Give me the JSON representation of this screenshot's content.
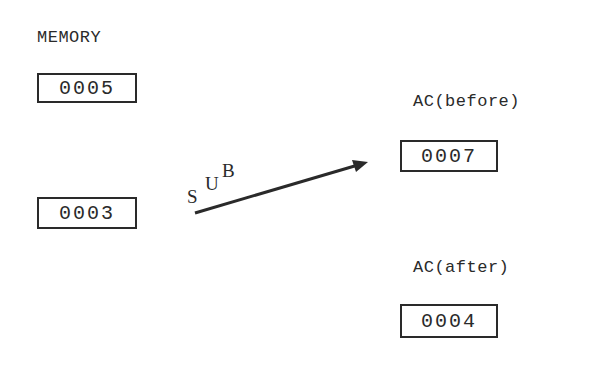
{
  "memory": {
    "title": "MEMORY",
    "cells": [
      {
        "value": "0005"
      },
      {
        "value": "0003"
      }
    ]
  },
  "operation": {
    "letters": [
      "S",
      "U",
      "B"
    ],
    "name": "SUB"
  },
  "accumulator": {
    "before": {
      "label": "AC(before)",
      "value": "0007"
    },
    "after": {
      "label": "AC(after)",
      "value": "0004"
    }
  }
}
